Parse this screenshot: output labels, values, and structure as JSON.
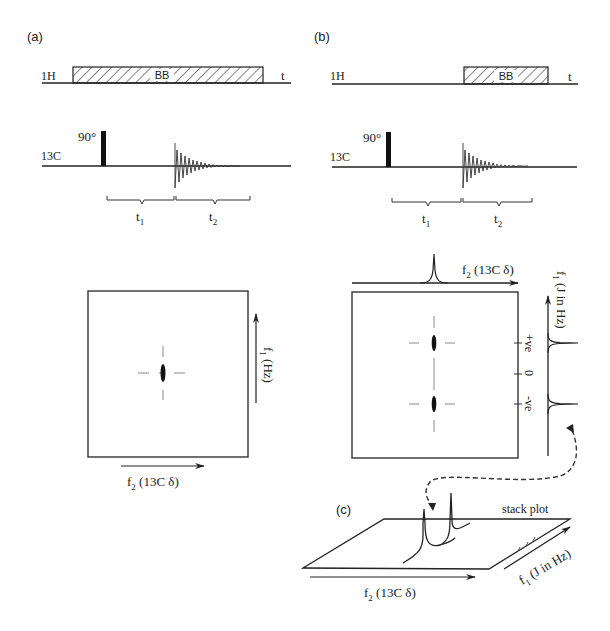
{
  "panel_a": {
    "label": "(a)",
    "h1_channel": "1H",
    "bb_label": "BB",
    "time_label": "t",
    "c13_channel": "13C",
    "pulse_label": "90°",
    "t1": "t",
    "t1_sub": "1",
    "t2": "t",
    "t2_sub": "2",
    "f1_axis": "f",
    "f1_sub": "1",
    "f1_unit": " (Hz)",
    "f2_axis": "f",
    "f2_sub": "2",
    "f2_unit": " (13C δ)"
  },
  "panel_b": {
    "label": "(b)",
    "h1_channel": "1H",
    "bb_label": "BB",
    "time_label": "t",
    "c13_channel": "13C",
    "pulse_label": "90°",
    "t1": "t",
    "t1_sub": "1",
    "t2": "t",
    "t2_sub": "2",
    "f2_axis": "f",
    "f2_sub": "2",
    "f2_unit": " (13C δ)",
    "f1_axis": "f",
    "f1_sub": "1",
    "f1_unit": " (J in Hz)",
    "tick_pos": "+ve",
    "tick_zero": "0",
    "tick_neg": "-ve"
  },
  "panel_c": {
    "label": "(c)",
    "title": "stack plot",
    "f2_axis": "f",
    "f2_sub": "2",
    "f2_unit": " (13C δ)",
    "f1_axis": "f",
    "f1_sub": "1",
    "f1_unit": " (J in Hz)"
  },
  "colors": {
    "line": "#222222",
    "dashed": "#888888",
    "hatch": "#333333"
  }
}
